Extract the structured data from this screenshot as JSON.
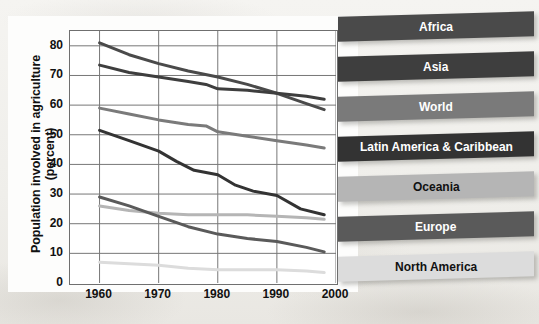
{
  "chart_data": {
    "type": "line",
    "title": "",
    "xlabel": "",
    "ylabel": "Population involved in agriculture (percent)",
    "xlim": [
      1955,
      2000
    ],
    "ylim": [
      0,
      85
    ],
    "xticks": [
      1960,
      1970,
      1980,
      1990,
      2000
    ],
    "yticks": [
      0,
      10,
      20,
      30,
      40,
      50,
      60,
      70,
      80
    ],
    "grid": true,
    "legend_position": "right",
    "series": [
      {
        "name": "Africa",
        "color": "#4a4a4a",
        "x": [
          1960,
          1965,
          1970,
          1975,
          1980,
          1985,
          1990,
          1995,
          1998
        ],
        "values": [
          81,
          77,
          74,
          71.5,
          69.5,
          67,
          64,
          60.5,
          58.5
        ]
      },
      {
        "name": "Asia",
        "color": "#3e3e3e",
        "x": [
          1960,
          1965,
          1970,
          1975,
          1978,
          1980,
          1985,
          1990,
          1995,
          1998
        ],
        "values": [
          73.5,
          71,
          69.5,
          68,
          67,
          65.5,
          65,
          64,
          63,
          62
        ]
      },
      {
        "name": "World",
        "color": "#7a7a7a",
        "x": [
          1960,
          1965,
          1970,
          1975,
          1978,
          1980,
          1985,
          1990,
          1995,
          1998
        ],
        "values": [
          59,
          57,
          55,
          53.5,
          53,
          51,
          49.5,
          48,
          46.5,
          45.5
        ]
      },
      {
        "name": "Latin America & Caribbean",
        "color": "#333333",
        "x": [
          1960,
          1965,
          1970,
          1973,
          1976,
          1980,
          1983,
          1986,
          1990,
          1994,
          1998
        ],
        "values": [
          51.5,
          48,
          44.5,
          41,
          38,
          36.5,
          33,
          31,
          29.5,
          25,
          23
        ]
      },
      {
        "name": "Oceania",
        "color": "#b5b5b5",
        "x": [
          1960,
          1965,
          1970,
          1975,
          1980,
          1985,
          1990,
          1995,
          1998
        ],
        "values": [
          26,
          24.5,
          23.5,
          23,
          23,
          23,
          22.5,
          22,
          21.5
        ]
      },
      {
        "name": "Europe",
        "color": "#5a5a5a",
        "x": [
          1960,
          1965,
          1970,
          1975,
          1980,
          1985,
          1990,
          1995,
          1998
        ],
        "values": [
          29,
          26,
          22.5,
          19,
          16.5,
          15,
          14,
          12,
          10.5
        ]
      },
      {
        "name": "North America",
        "color": "#dcdcdc",
        "x": [
          1960,
          1965,
          1970,
          1975,
          1980,
          1985,
          1990,
          1995,
          1998
        ],
        "values": [
          7,
          6.5,
          6,
          5,
          4.5,
          4.5,
          4.5,
          4,
          3.5
        ]
      }
    ]
  },
  "axis": {
    "y_title": "Population involved in agriculture (percent)",
    "y_ticks": [
      "80",
      "70",
      "60",
      "50",
      "40",
      "30",
      "20",
      "10",
      "0"
    ],
    "x_ticks": [
      "1960",
      "1970",
      "1980",
      "1990",
      "2000"
    ]
  },
  "legend": {
    "items": [
      {
        "label": "Africa",
        "color": "#4a4a4a"
      },
      {
        "label": "Asia",
        "color": "#3e3e3e"
      },
      {
        "label": "World",
        "color": "#7a7a7a"
      },
      {
        "label": "Latin America & Caribbean",
        "color": "#333333"
      },
      {
        "label": "Oceania",
        "color": "#b5b5b5"
      },
      {
        "label": "Europe",
        "color": "#5a5a5a"
      },
      {
        "label": "North America",
        "color": "#dcdcdc"
      }
    ]
  }
}
